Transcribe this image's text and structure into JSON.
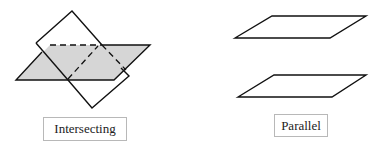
{
  "diagrams": [
    {
      "id": "intersecting",
      "label": "Intersecting",
      "fill_color": "#d6d6d6",
      "stroke_color": "#111111"
    },
    {
      "id": "parallel",
      "label": "Parallel",
      "stroke_color": "#111111"
    }
  ]
}
